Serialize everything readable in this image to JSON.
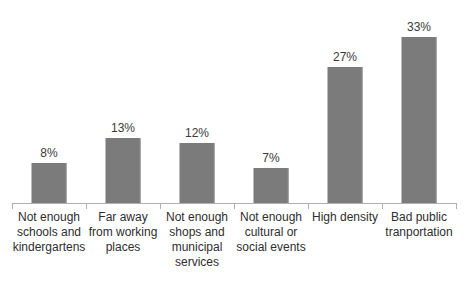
{
  "chart_data": {
    "type": "bar",
    "title": "",
    "subtitle": "",
    "xlabel": "",
    "ylabel": "",
    "ylim": [
      0,
      35
    ],
    "grid": false,
    "legend": false,
    "legend_position": "none",
    "orientation": "vertical",
    "bar_color": "#7b7b7b",
    "axis_color": "#b0b0b0",
    "label_color": "#2e2e2e",
    "background": "#ffffff",
    "categories": [
      "Not enough schools and kindergartens",
      "Far away from working places",
      "Not enough shops and municipal services",
      "Not enough cultural or social events",
      "High density",
      "Bad public tranportation"
    ],
    "category_lines": [
      [
        "Not enough",
        "schools and",
        "kindergartens"
      ],
      [
        "Far away",
        "from working",
        "places"
      ],
      [
        "Not enough",
        "shops and",
        "municipal",
        "services"
      ],
      [
        "Not enough",
        "cultural or",
        "social events"
      ],
      [
        "High density"
      ],
      [
        "Bad public",
        "tranportation"
      ]
    ],
    "values": [
      8,
      13,
      12,
      7,
      27,
      33
    ],
    "value_labels": [
      "8%",
      "13%",
      "12%",
      "7%",
      "27%",
      "33%"
    ],
    "series": [
      {
        "name": "Share of respondents",
        "values": [
          8,
          13,
          12,
          7,
          27,
          33
        ]
      }
    ]
  }
}
